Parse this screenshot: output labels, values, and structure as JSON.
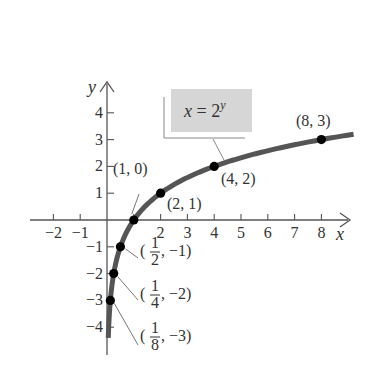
{
  "chart_data": {
    "type": "line",
    "title": "",
    "equation_label": "x = 2^y",
    "equation": {
      "lhs": "x",
      "eq": "=",
      "base": "2",
      "exp": "y"
    },
    "xlabel": "x",
    "ylabel": "y",
    "xlim": [
      -2.8,
      9
    ],
    "ylim": [
      -4.2,
      4.8
    ],
    "x_ticks": [
      -2,
      -1,
      1,
      2,
      3,
      4,
      5,
      6,
      7,
      8
    ],
    "x_tick_labels": [
      "−2",
      "−1",
      "",
      "2",
      "3",
      "4",
      "5",
      "6",
      "7",
      "8"
    ],
    "y_ticks": [
      -4,
      -3,
      -2,
      -1,
      1,
      2,
      3,
      4
    ],
    "y_tick_labels": [
      "−4",
      "−3",
      "−2",
      "−1",
      "1",
      "2",
      "3",
      "4"
    ],
    "grid": false,
    "curve": {
      "name": "x = 2^y",
      "x_range": [
        0.0625,
        9.2
      ],
      "color": "#555555"
    },
    "points": [
      {
        "x": 0.125,
        "y": -3,
        "label_num": "1",
        "label_den": "8",
        "label_y": "−3"
      },
      {
        "x": 0.25,
        "y": -2,
        "label_num": "1",
        "label_den": "4",
        "label_y": "−2"
      },
      {
        "x": 0.5,
        "y": -1,
        "label_num": "1",
        "label_den": "2",
        "label_y": "−1"
      },
      {
        "x": 1,
        "y": 0,
        "label": "(1, 0)"
      },
      {
        "x": 2,
        "y": 1,
        "label": "(2, 1)"
      },
      {
        "x": 4,
        "y": 2,
        "label": "(4, 2)"
      },
      {
        "x": 8,
        "y": 3,
        "label": "(8, 3)"
      }
    ],
    "colors": {
      "axis": "#555555",
      "curve": "#555555",
      "point": "#000000",
      "label_box": "#d6d6d6"
    }
  }
}
